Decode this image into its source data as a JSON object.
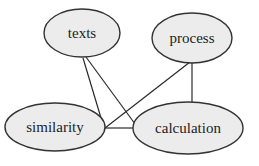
{
  "diagram": {
    "type": "concept-graph",
    "nodes": [
      {
        "id": "texts",
        "label": "texts",
        "cx": 82,
        "cy": 33,
        "rx": 38,
        "ry": 24
      },
      {
        "id": "process",
        "label": "process",
        "cx": 192,
        "cy": 38,
        "rx": 40,
        "ry": 25
      },
      {
        "id": "similarity",
        "label": "similarity",
        "cx": 55,
        "cy": 127,
        "rx": 50,
        "ry": 24
      },
      {
        "id": "calculation",
        "label": "calculation",
        "cx": 188,
        "cy": 128,
        "rx": 55,
        "ry": 26
      }
    ],
    "edges": [
      {
        "from": "texts",
        "to": "similarity",
        "x1": 83,
        "y1": 58,
        "x2": 104,
        "y2": 128
      },
      {
        "from": "texts",
        "to": "calculation",
        "x1": 86,
        "y1": 57,
        "x2": 138,
        "y2": 128
      },
      {
        "from": "process",
        "to": "similarity",
        "x1": 190,
        "y1": 62,
        "x2": 105,
        "y2": 128
      },
      {
        "from": "process",
        "to": "calculation",
        "x1": 192,
        "y1": 63,
        "x2": 192,
        "y2": 102
      },
      {
        "from": "similarity",
        "to": "calculation",
        "x1": 105,
        "y1": 128,
        "x2": 133,
        "y2": 128
      }
    ],
    "colors": {
      "node_fill": "#ececec",
      "node_stroke": "#333333",
      "edge": "#2a2a2a",
      "text": "#222222",
      "background": "#ffffff"
    }
  }
}
